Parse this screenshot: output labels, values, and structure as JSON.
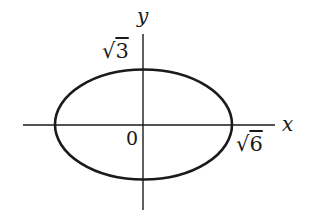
{
  "diagram": {
    "type": "ellipse-on-axes",
    "colors": {
      "background": "#ffffff",
      "ink": "#1a1a1a"
    },
    "axes": {
      "x_label": "x",
      "y_label": "y",
      "origin_label": "0"
    },
    "ellipse": {
      "semi_major_label": "√6",
      "semi_minor_label": "√3"
    },
    "labels": {
      "y_intercept": {
        "radical": "√",
        "radicand": "3"
      },
      "x_intercept": {
        "radical": "√",
        "radicand": "6"
      }
    }
  }
}
